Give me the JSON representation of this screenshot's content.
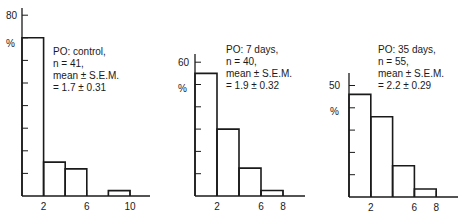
{
  "chart_data": [
    {
      "type": "bar",
      "subtype": "histogram",
      "title": "PO: control",
      "annotation": [
        "PO: control,",
        "n = 41,",
        "mean ± S.E.M.",
        "= 1.7 ± 0.31"
      ],
      "n": 41,
      "mean": 1.7,
      "sem": 0.31,
      "xlabel": "",
      "ylabel": "%",
      "bins": [
        [
          0,
          2
        ],
        [
          2,
          4
        ],
        [
          4,
          6
        ],
        [
          6,
          8
        ],
        [
          8,
          10
        ]
      ],
      "values": [
        70,
        15,
        12,
        0,
        2.4
      ],
      "x_ticks": [
        2,
        4,
        6,
        8,
        10
      ],
      "x_tick_labels": [
        "2",
        "6",
        "10"
      ],
      "x_tick_label_values": [
        2,
        6,
        10
      ],
      "y_tick_step": 10,
      "y_tick_labels": [
        "80"
      ],
      "y_tick_label_values": [
        80
      ],
      "ylim": [
        0,
        80
      ],
      "xlim": [
        0,
        12
      ]
    },
    {
      "type": "bar",
      "subtype": "histogram",
      "title": "PO: 7 days",
      "annotation": [
        "PO: 7 days,",
        "n = 40,",
        "mean ± S.E.M.",
        "= 1.9 ± 0.32"
      ],
      "n": 40,
      "mean": 1.9,
      "sem": 0.32,
      "xlabel": "",
      "ylabel": "%",
      "bins": [
        [
          0,
          2
        ],
        [
          2,
          4
        ],
        [
          4,
          6
        ],
        [
          6,
          8
        ]
      ],
      "values": [
        55,
        30,
        12.5,
        2.5
      ],
      "x_ticks": [
        2,
        4,
        6,
        8
      ],
      "x_tick_labels": [
        "2",
        "6",
        "8"
      ],
      "x_tick_label_values": [
        2,
        6,
        8
      ],
      "y_tick_step": 10,
      "y_tick_labels": [
        "60"
      ],
      "y_tick_label_values": [
        60
      ],
      "ylim": [
        0,
        63
      ],
      "xlim": [
        0,
        10
      ]
    },
    {
      "type": "bar",
      "subtype": "histogram",
      "title": "PO: 35 days",
      "annotation": [
        "PO: 35 days,",
        "n = 55,",
        "mean ± S.E.M.",
        "= 2.2 ± 0.29"
      ],
      "n": 55,
      "mean": 2.2,
      "sem": 0.29,
      "xlabel": "",
      "ylabel": "%",
      "bins": [
        [
          0,
          2
        ],
        [
          2,
          4
        ],
        [
          4,
          6
        ],
        [
          6,
          8
        ]
      ],
      "values": [
        46,
        36,
        14,
        3.6
      ],
      "x_ticks": [
        2,
        4,
        6,
        8
      ],
      "x_tick_labels": [
        "2",
        "6",
        "8"
      ],
      "x_tick_label_values": [
        2,
        6,
        8
      ],
      "y_tick_step": 10,
      "y_tick_labels": [
        "50"
      ],
      "y_tick_label_values": [
        50
      ],
      "ylim": [
        0,
        55
      ],
      "xlim": [
        0,
        10
      ]
    }
  ],
  "layout": {
    "panels": [
      {
        "origin_x": 22,
        "baseline_y": 196,
        "px_per_x": 10.8,
        "px_per_pct": 2.26,
        "axis_top": 8,
        "axis_right": 150,
        "ylabel_pos": [
          6,
          47
        ],
        "ytick_label_pos": [
          6,
          19
        ],
        "annotation_pos": [
          53,
          55
        ]
      },
      {
        "origin_x": 195,
        "baseline_y": 196,
        "px_per_x": 11.0,
        "px_per_pct": 2.23,
        "axis_top": 54,
        "axis_right": 305,
        "ylabel_pos": [
          178,
          92
        ],
        "ytick_label_pos": [
          178,
          66
        ],
        "annotation_pos": [
          226,
          53
        ]
      },
      {
        "origin_x": 349,
        "baseline_y": 197,
        "px_per_x": 10.9,
        "px_per_pct": 2.23,
        "axis_top": 73,
        "axis_right": 458,
        "ylabel_pos": [
          330,
          115
        ],
        "ytick_label_pos": [
          329,
          89
        ],
        "annotation_pos": [
          378,
          53
        ]
      }
    ]
  }
}
